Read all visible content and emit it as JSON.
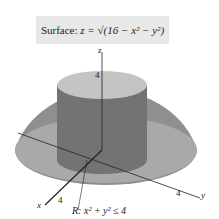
{
  "caption": {
    "prefix": "Surface:",
    "equation": "z = √(16 − x² − y²)"
  },
  "axes": {
    "x": "x",
    "y": "y",
    "z": "z"
  },
  "ticks": {
    "z": "4",
    "x": "4",
    "y": "4"
  },
  "region_label": "R: x² + y² ≤ 4",
  "colors": {
    "hemisphere": "#8a8a8a",
    "cylinder": "#6e6e6e",
    "top": "#bdbdbd",
    "base": "#a8a8a8",
    "caption_bg": "#e8e8e8"
  }
}
